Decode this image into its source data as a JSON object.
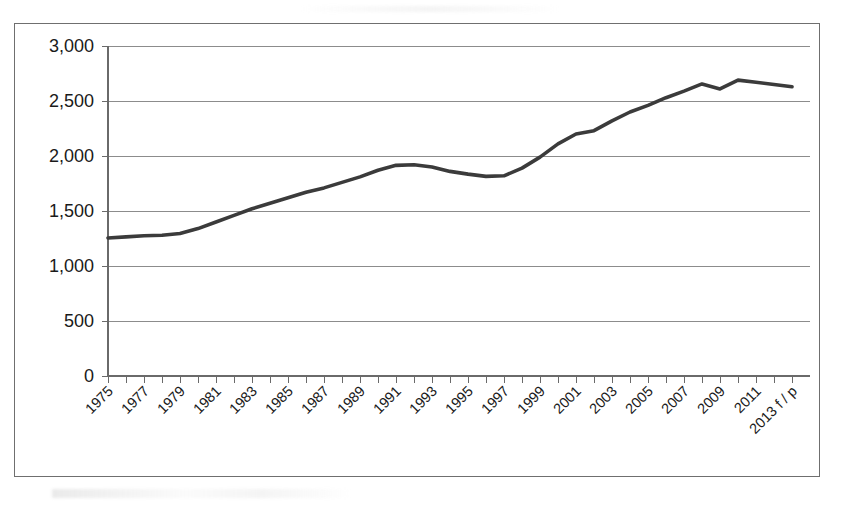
{
  "chart_data": {
    "type": "line",
    "title": "",
    "subtitle": "",
    "xlabel": "",
    "ylabel": "",
    "ylim": [
      0,
      3000
    ],
    "yticks": [
      0,
      500,
      1000,
      1500,
      2000,
      2500,
      3000
    ],
    "ytick_labels": [
      "0",
      "500",
      "1,000",
      "1,500",
      "2,000",
      "2,500",
      "3,000"
    ],
    "grid": true,
    "legend": false,
    "legend_position": "none",
    "x_tick_rotation": -45,
    "x_all": [
      "1975",
      "1976",
      "1977",
      "1978",
      "1979",
      "1980",
      "1981",
      "1982",
      "1983",
      "1984",
      "1985",
      "1986",
      "1987",
      "1988",
      "1989",
      "1990",
      "1991",
      "1992",
      "1993",
      "1994",
      "1995",
      "1996",
      "1997",
      "1998",
      "1999",
      "2000",
      "2001",
      "2002",
      "2003",
      "2004",
      "2005",
      "2006",
      "2007",
      "2008",
      "2009",
      "2010",
      "2011",
      "2012",
      "2013 f / p"
    ],
    "xtick_labels": [
      "1975",
      "1977",
      "1979",
      "1981",
      "1983",
      "1985",
      "1987",
      "1989",
      "1991",
      "1993",
      "1995",
      "1997",
      "1999",
      "2001",
      "2003",
      "2005",
      "2007",
      "2009",
      "2011",
      "2013 f / p"
    ],
    "categories": [
      "1975",
      "1976",
      "1977",
      "1978",
      "1979",
      "1980",
      "1981",
      "1982",
      "1983",
      "1984",
      "1985",
      "1986",
      "1987",
      "1988",
      "1989",
      "1990",
      "1991",
      "1992",
      "1993",
      "1994",
      "1995",
      "1996",
      "1997",
      "1998",
      "1999",
      "2000",
      "2001",
      "2002",
      "2003",
      "2004",
      "2005",
      "2006",
      "2007",
      "2008",
      "2009",
      "2010",
      "2011",
      "2012",
      "2013 f / p"
    ],
    "values": [
      1255,
      1265,
      1275,
      1280,
      1295,
      1340,
      1400,
      1460,
      1520,
      1570,
      1620,
      1670,
      1710,
      1760,
      1810,
      1870,
      1915,
      1920,
      1900,
      1860,
      1835,
      1815,
      1820,
      1890,
      1990,
      2110,
      2200,
      2230,
      2320,
      2400,
      2460,
      2530,
      2590,
      2655,
      2610,
      2690,
      2670,
      2650,
      2630
    ],
    "series": [
      {
        "name": "series-1",
        "color": "#3b3b3b",
        "values": [
          1255,
          1265,
          1275,
          1280,
          1295,
          1340,
          1400,
          1460,
          1520,
          1570,
          1620,
          1670,
          1710,
          1760,
          1810,
          1870,
          1915,
          1920,
          1900,
          1860,
          1835,
          1815,
          1820,
          1890,
          1990,
          2110,
          2200,
          2230,
          2320,
          2400,
          2460,
          2530,
          2590,
          2655,
          2610,
          2690,
          2670,
          2650,
          2630
        ]
      }
    ],
    "notes": {
      "last_point_annotation": "f / p",
      "line_style": "solid",
      "markers": "none"
    }
  },
  "colors": {
    "line": "#3b3b3b",
    "grid": "#8c8c8c",
    "axis": "#6a6a6a",
    "frame": "#6f6f6f",
    "text": "#1a1a1a",
    "background": "#ffffff"
  }
}
